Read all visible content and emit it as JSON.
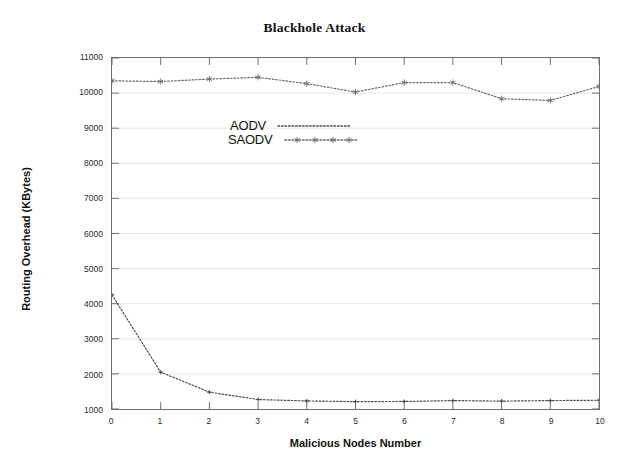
{
  "chart_data": {
    "type": "line",
    "title": "Blackhole Attack",
    "xlabel": "Malicious Nodes Number",
    "ylabel": "Routing Overhead (KBytes)",
    "x": [
      0,
      1,
      2,
      3,
      4,
      5,
      6,
      7,
      8,
      9,
      10
    ],
    "xtick_labels": [
      "0",
      "1",
      "2",
      "3",
      "4",
      "5",
      "6",
      "7",
      "8",
      "9",
      "10"
    ],
    "ytick_labels": [
      "1000",
      "2000",
      "3000",
      "4000",
      "5000",
      "6000",
      "7000",
      "8000",
      "9000",
      "10000",
      "11000"
    ],
    "yticks": [
      1000,
      2000,
      3000,
      4000,
      5000,
      6000,
      7000,
      8000,
      9000,
      10000,
      11000
    ],
    "xlim": [
      0,
      10
    ],
    "ylim": [
      1000,
      11000
    ],
    "grid": true,
    "grid_axis": "y",
    "legend_position": "top-left-inside",
    "series": [
      {
        "name": "AODV",
        "line_style": "dotted",
        "color": "#4d4d4d",
        "marker": "none",
        "values": [
          4250,
          2050,
          1480,
          1270,
          1230,
          1210,
          1215,
          1240,
          1225,
          1240,
          1250
        ]
      },
      {
        "name": "SAODV",
        "line_style": "dotted",
        "color": "#6a6a6a",
        "marker": "asterisk",
        "values": [
          10350,
          10330,
          10400,
          10450,
          10270,
          10030,
          10300,
          10300,
          9840,
          9790,
          10190
        ]
      }
    ]
  },
  "legend": {
    "entries": [
      {
        "label": "AODV"
      },
      {
        "label": "SAODV"
      }
    ]
  }
}
